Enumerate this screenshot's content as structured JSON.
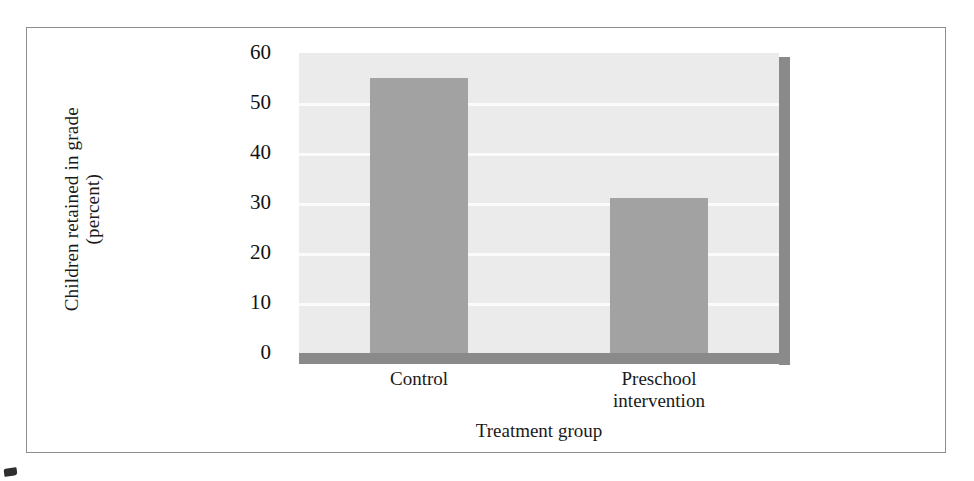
{
  "chart_data": {
    "type": "bar",
    "title": "",
    "categories": [
      "Control",
      "Preschool\nintervention"
    ],
    "values": [
      55,
      31
    ],
    "series": [
      {
        "name": "Children retained in grade (percent)",
        "values": [
          55,
          31
        ]
      }
    ],
    "xlabel": "Treatment group",
    "ylabel": "Children retained in grade\n(percent)",
    "ylim": [
      0,
      60
    ],
    "yticks": [
      60,
      50,
      40,
      30,
      20,
      10,
      0
    ],
    "ytick_labels": [
      "60",
      "50",
      "40",
      "30",
      "20",
      "10",
      "0"
    ],
    "gridlines": [
      50,
      40,
      30,
      20,
      10
    ],
    "grid": true,
    "legend": false,
    "legend_position": "none",
    "bar_color": "#a2a2a2",
    "plot_background": "#ebebeb",
    "gridline_color": "#fbfbfb",
    "axis_shadow_color": "#8a8a8a",
    "frame_color": "#8d8d8d",
    "text_color": "#1a1a1a"
  },
  "figure": {
    "y_axis_title": "Children retained in grade\n(percent)",
    "x_axis_title": "Treatment group",
    "category_labels": [
      "Control",
      "Preschool\nintervention"
    ]
  }
}
